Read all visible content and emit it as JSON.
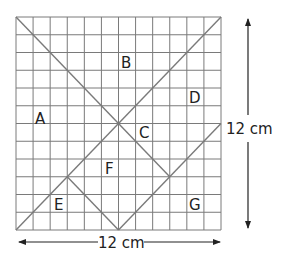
{
  "diagram": {
    "type": "tangram-grid",
    "grid": {
      "columns": 12,
      "rows": 12,
      "line_color": "#7a7a7a"
    },
    "cut_line_color": "#7a7a7a",
    "pieces": [
      {
        "id": "A",
        "label": "A"
      },
      {
        "id": "B",
        "label": "B"
      },
      {
        "id": "C",
        "label": "C"
      },
      {
        "id": "D",
        "label": "D"
      },
      {
        "id": "E",
        "label": "E"
      },
      {
        "id": "F",
        "label": "F"
      },
      {
        "id": "G",
        "label": "G"
      }
    ],
    "cut_lines_grid_units": [
      {
        "from": [
          0,
          0
        ],
        "to": [
          9,
          9
        ]
      },
      {
        "from": [
          12,
          0
        ],
        "to": [
          0,
          12
        ]
      },
      {
        "from": [
          12,
          6
        ],
        "to": [
          6,
          12
        ]
      },
      {
        "from": [
          3,
          9
        ],
        "to": [
          6,
          12
        ]
      }
    ],
    "dimensions": {
      "width_label": "12 cm",
      "height_label": "12 cm"
    }
  }
}
